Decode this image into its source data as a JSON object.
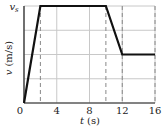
{
  "chart_data": {
    "type": "line",
    "title": "",
    "xlabel": "t (s)",
    "ylabel": "v (m/s)",
    "x_var": "t",
    "x_unit": "(s)",
    "y_var": "v",
    "y_unit": "(m/s)",
    "x_ticks": [
      "0",
      "4",
      "8",
      "12",
      "16"
    ],
    "y_tick_top": "v_s",
    "y_tick_top_main": "v",
    "y_tick_top_sub": "s",
    "xlim": [
      0,
      16
    ],
    "ylim_fraction_of_vs": [
      0,
      1
    ],
    "grid": true,
    "grid_y_divisions": 4,
    "series": [
      {
        "name": "v(t)",
        "points_t": [
          0,
          2,
          10,
          12,
          16
        ],
        "points_v_fraction_of_vs": [
          0,
          1,
          1,
          0.5,
          0.5
        ]
      }
    ],
    "dashed_verticals_t": [
      2,
      10,
      12,
      16
    ]
  },
  "colors": {
    "curve": "#111111",
    "grid": "#c8c8c8",
    "axis": "#222222",
    "dashed": "#888888"
  }
}
